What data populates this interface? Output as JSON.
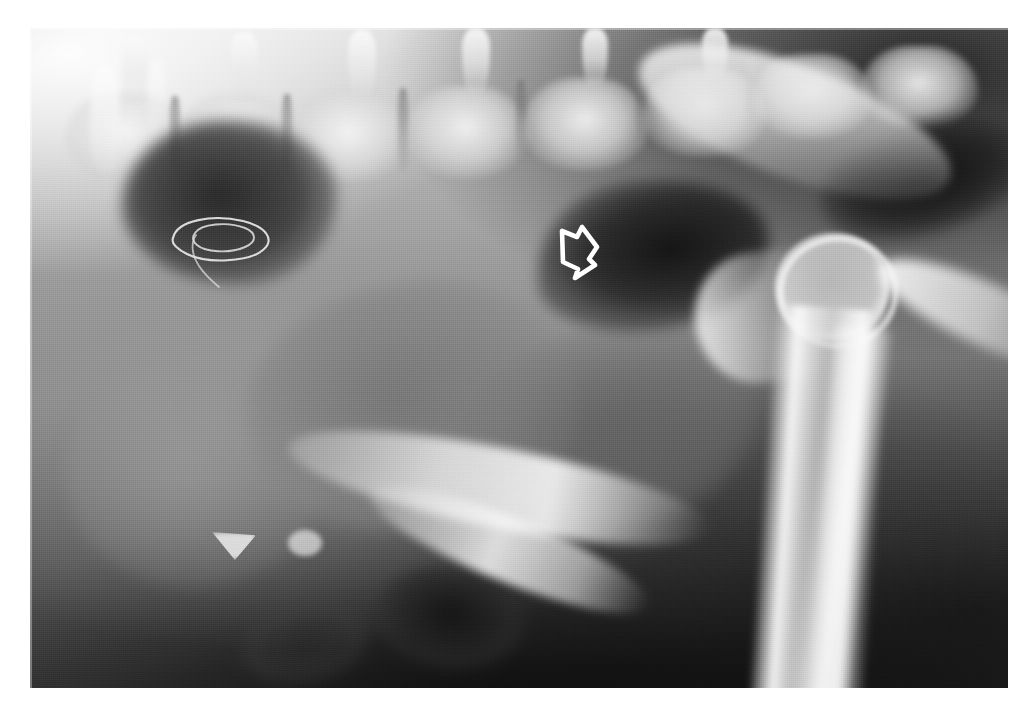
{
  "image": {
    "kind": "radiograph",
    "modality": "X-ray",
    "view": "lateral",
    "title": "Lateral abdominal radiograph",
    "film": {
      "left": 30,
      "top": 28,
      "width": 978,
      "height": 660,
      "background_color": "#8d8d8d",
      "page_background_color": "#ffffff"
    },
    "tone": {
      "highlight_color": "#fbfbfb",
      "midtone_color": "#8d8d8d",
      "shadow_color": "#1a1a1a",
      "gas_color": "#141414",
      "bone_color": "#f4f4f4"
    }
  },
  "anatomy": {
    "structures": [
      {
        "id": "vertebral-column",
        "label": "Vertebral column",
        "region": "top band"
      },
      {
        "id": "spinous-processes",
        "label": "Spinous processes",
        "region": "dorsal"
      },
      {
        "id": "gas-stomach",
        "label": "Gas-filled viscus",
        "region": "cranioventral"
      },
      {
        "id": "gas-colon",
        "label": "Gas-filled colon segment",
        "region": "mid-caudal"
      },
      {
        "id": "gas-upper-right",
        "label": "Gas lucency",
        "region": "caudodorsal"
      },
      {
        "id": "liver-mass",
        "label": "Soft tissue mass",
        "region": "mid-ventral"
      },
      {
        "id": "femoral-head",
        "label": "Femoral head",
        "region": "caudal"
      },
      {
        "id": "bone-shaft",
        "label": "Femoral shaft",
        "region": "caudoventral"
      },
      {
        "id": "pelvic-blade",
        "label": "Pelvic blade",
        "region": "caudodorsal"
      },
      {
        "id": "ilium",
        "label": "Ilium",
        "region": "mid"
      },
      {
        "id": "ischium",
        "label": "Ischium",
        "region": "caudoventral"
      }
    ]
  },
  "annotations": {
    "arrow": {
      "name": "hollow-arrow-marker",
      "style": "open outline arrow",
      "stroke_color": "#ffffff",
      "fill": "none",
      "points_toward": "down-right",
      "x": 551,
      "y": 218,
      "width": 60,
      "height": 68,
      "target": "gas-colon"
    },
    "loop": {
      "name": "loop-marker",
      "style": "thin closed curved loop",
      "stroke_color": "#e8e8e8",
      "fill": "none",
      "x": 155,
      "y": 190,
      "width": 130,
      "height": 100,
      "target": "gas-stomach"
    }
  },
  "labels": {
    "none_visible": true
  }
}
